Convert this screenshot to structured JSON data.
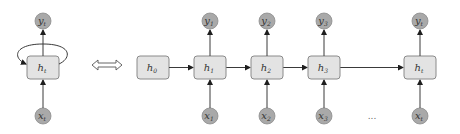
{
  "diagram": {
    "folded": {
      "hidden": {
        "base": "h",
        "sub": "t"
      },
      "input": {
        "base": "x",
        "sub": "t"
      },
      "output": {
        "base": "y",
        "sub": "t"
      },
      "self_loop": true
    },
    "equivalence_symbol": "⟺",
    "unfolded": {
      "initial": {
        "base": "h",
        "sub": "0"
      },
      "steps": [
        {
          "hidden": {
            "base": "h",
            "sub": "1"
          },
          "input": {
            "base": "x",
            "sub": "1"
          },
          "output": {
            "base": "y",
            "sub": "1"
          }
        },
        {
          "hidden": {
            "base": "h",
            "sub": "2"
          },
          "input": {
            "base": "x",
            "sub": "2"
          },
          "output": {
            "base": "y",
            "sub": "2"
          }
        },
        {
          "hidden": {
            "base": "h",
            "sub": "3"
          },
          "input": {
            "base": "x",
            "sub": "3"
          },
          "output": {
            "base": "y",
            "sub": "3"
          }
        },
        {
          "hidden": {
            "base": "h",
            "sub": "t"
          },
          "input": {
            "base": "x",
            "sub": "t"
          },
          "output": {
            "base": "y",
            "sub": "t"
          }
        }
      ],
      "ellipsis": "..."
    },
    "colors": {
      "box_fill": "#e3e3e3",
      "box_stroke": "#8a8a8a",
      "circle_fill": "#a9a9a9",
      "arrow": "#3a3a3a"
    }
  }
}
